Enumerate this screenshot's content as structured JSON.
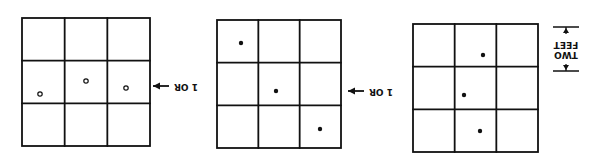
{
  "diagram": {
    "orientation": "rotated-180",
    "stroke_color": "#111111",
    "background": "#ffffff",
    "grids": [
      {
        "id": "grid-left",
        "box": {
          "x": 22,
          "y": 18,
          "w": 128,
          "h": 128
        },
        "rows": 3,
        "cols": 3,
        "dots": [
          {
            "x": 40,
            "y": 94,
            "style": "hollow"
          },
          {
            "x": 86,
            "y": 81,
            "style": "hollow"
          },
          {
            "x": 126,
            "y": 88,
            "style": "hollow"
          }
        ]
      },
      {
        "id": "grid-middle",
        "box": {
          "x": 217,
          "y": 20,
          "w": 124,
          "h": 128
        },
        "rows": 3,
        "cols": 3,
        "dots": [
          {
            "x": 241,
            "y": 43,
            "style": "solid"
          },
          {
            "x": 276,
            "y": 91,
            "style": "solid"
          },
          {
            "x": 320,
            "y": 129,
            "style": "solid"
          }
        ]
      },
      {
        "id": "grid-right",
        "box": {
          "x": 413,
          "y": 24,
          "w": 125,
          "h": 128
        },
        "rows": 3,
        "cols": 3,
        "dots": [
          {
            "x": 483,
            "y": 55,
            "style": "solid"
          },
          {
            "x": 464,
            "y": 95,
            "style": "solid"
          },
          {
            "x": 480,
            "y": 131,
            "style": "solid"
          }
        ]
      }
    ],
    "connectors": [
      {
        "label": "1 OR",
        "arrow": "left",
        "x1": 153,
        "x2": 205,
        "y": 86
      },
      {
        "label": "1 OR",
        "arrow": "left",
        "x1": 348,
        "x2": 402,
        "y": 91
      }
    ],
    "dimension": {
      "label_line1": "TWO",
      "label_line2": "FEET",
      "x": 566,
      "y_top": 27,
      "y_bottom": 71
    }
  }
}
